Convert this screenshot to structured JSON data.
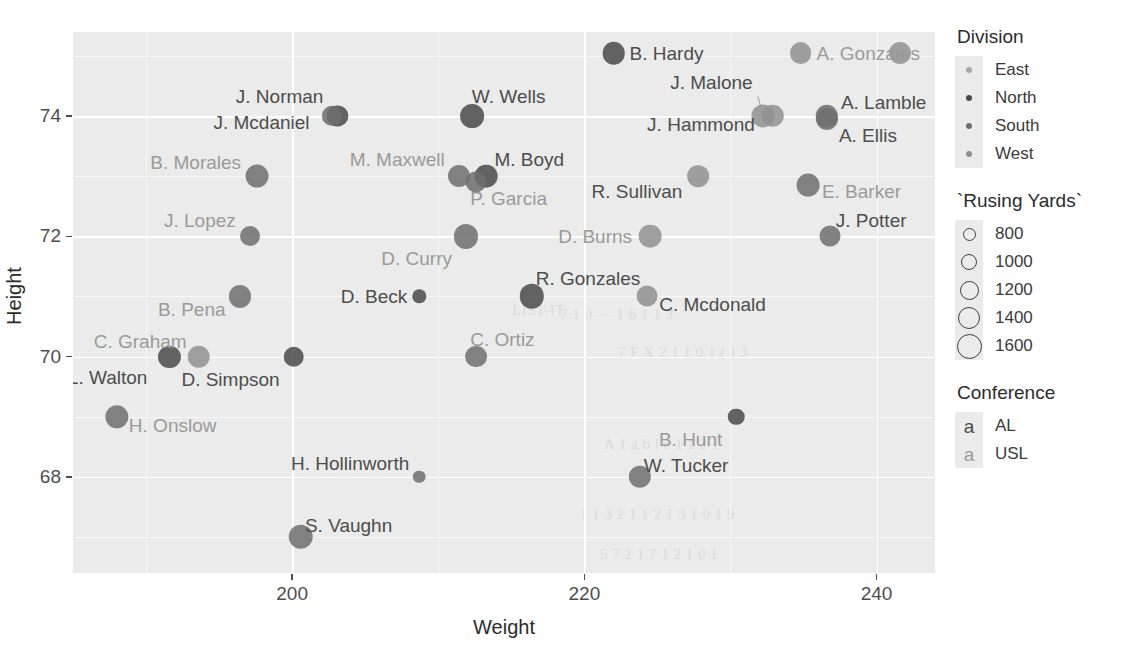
{
  "chart_data": {
    "type": "scatter",
    "title": "",
    "xlabel": "Weight",
    "ylabel": "Height",
    "xlim": [
      185,
      244
    ],
    "ylim": [
      66.4,
      75.4
    ],
    "xticks": [
      200,
      220,
      240
    ],
    "yticks": [
      68,
      70,
      72,
      74
    ],
    "grid": true,
    "legend_position": "right",
    "size_legend_title": "`Rusing Yards`",
    "color_legend_title": "Division",
    "text_legend_title": "Conference",
    "points": [
      {
        "label": "B. Hardy",
        "weight": 222.0,
        "height": 75.05,
        "rushing_yards": 1290,
        "division": "North",
        "conference": "AL",
        "label_side": "right",
        "label_dx": 16,
        "label_dy": 0
      },
      {
        "label": "A. Gonzales",
        "weight": 234.8,
        "height": 75.05,
        "rushing_yards": 1230,
        "division": "West",
        "conference": "USL",
        "label_side": "right",
        "label_dx": 16,
        "label_dy": 0
      },
      {
        "label": "Gonzales",
        "weight": 241.6,
        "height": 75.05,
        "rushing_yards": 1250,
        "division": "West",
        "conference": "USL",
        "label_side": "none",
        "label_dx": 0,
        "label_dy": 0
      },
      {
        "label": "J. Norman",
        "weight": 203.1,
        "height": 74.0,
        "rushing_yards": 1180,
        "division": "North",
        "conference": "AL",
        "label_side": "left",
        "label_dx": -14,
        "label_dy": -20
      },
      {
        "label": "J. Mcdaniel",
        "weight": 202.7,
        "height": 74.0,
        "rushing_yards": 1120,
        "division": "South",
        "conference": "AL",
        "label_side": "left",
        "label_dx": -22,
        "label_dy": 6
      },
      {
        "label": "W. Wells",
        "weight": 212.3,
        "height": 74.0,
        "rushing_yards": 1390,
        "division": "North",
        "conference": "AL",
        "label_side": "right",
        "label_dx": 0,
        "label_dy": -20
      },
      {
        "label": "J. Malone",
        "weight": 232.2,
        "height": 74.0,
        "rushing_yards": 1330,
        "division": "West",
        "conference": "AL",
        "label_side": "left",
        "label_dx": -10,
        "label_dy": -34
      },
      {
        "label": "J. Hammond",
        "weight": 232.9,
        "height": 74.0,
        "rushing_yards": 1270,
        "division": "West",
        "conference": "AL",
        "label_side": "left",
        "label_dx": -18,
        "label_dy": 8
      },
      {
        "label": "A. Lamble",
        "weight": 236.6,
        "height": 74.0,
        "rushing_yards": 1280,
        "division": "South",
        "conference": "AL",
        "label_side": "right",
        "label_dx": 14,
        "label_dy": -14
      },
      {
        "label": "A. Ellis",
        "weight": 236.6,
        "height": 73.95,
        "rushing_yards": 1250,
        "division": "South",
        "conference": "AL",
        "label_side": "right",
        "label_dx": 12,
        "label_dy": 16
      },
      {
        "label": "B. Morales",
        "weight": 197.6,
        "height": 73.0,
        "rushing_yards": 1320,
        "division": "South",
        "conference": "USL",
        "label_side": "left",
        "label_dx": -16,
        "label_dy": -14
      },
      {
        "label": "M. Maxwell",
        "weight": 211.4,
        "height": 73.0,
        "rushing_yards": 1250,
        "division": "South",
        "conference": "USL",
        "label_side": "left",
        "label_dx": -14,
        "label_dy": -17
      },
      {
        "label": "M. Boyd",
        "weight": 213.3,
        "height": 73.0,
        "rushing_yards": 1300,
        "division": "North",
        "conference": "AL",
        "label_side": "right",
        "label_dx": 8,
        "label_dy": -17
      },
      {
        "label": "P. Garcia",
        "weight": 212.6,
        "height": 72.9,
        "rushing_yards": 1180,
        "division": "South",
        "conference": "USL",
        "label_side": "right",
        "label_dx": -6,
        "label_dy": 16
      },
      {
        "label": "R. Sullivan",
        "weight": 227.8,
        "height": 73.0,
        "rushing_yards": 1220,
        "division": "West",
        "conference": "AL",
        "label_side": "left",
        "label_dx": -16,
        "label_dy": 15
      },
      {
        "label": "E. Barker",
        "weight": 235.3,
        "height": 72.85,
        "rushing_yards": 1310,
        "division": "South",
        "conference": "USL",
        "label_side": "right",
        "label_dx": 14,
        "label_dy": 6
      },
      {
        "label": "J. Lopez",
        "weight": 197.1,
        "height": 72.0,
        "rushing_yards": 1100,
        "division": "South",
        "conference": "USL",
        "label_side": "left",
        "label_dx": -14,
        "label_dy": -16
      },
      {
        "label": "D. Curry",
        "weight": 211.9,
        "height": 72.0,
        "rushing_yards": 1420,
        "division": "South",
        "conference": "USL",
        "label_side": "left",
        "label_dx": -14,
        "label_dy": 22
      },
      {
        "label": "D. Burns",
        "weight": 224.5,
        "height": 72.0,
        "rushing_yards": 1300,
        "division": "West",
        "conference": "USL",
        "label_side": "left",
        "label_dx": -18,
        "label_dy": 0
      },
      {
        "label": "J. Potter",
        "weight": 236.8,
        "height": 72.0,
        "rushing_yards": 1170,
        "division": "South",
        "conference": "AL",
        "label_side": "right",
        "label_dx": 6,
        "label_dy": -16
      },
      {
        "label": "B. Pena",
        "weight": 196.4,
        "height": 71.0,
        "rushing_yards": 1250,
        "division": "South",
        "conference": "USL",
        "label_side": "left",
        "label_dx": -14,
        "label_dy": 13
      },
      {
        "label": "D. Beck",
        "weight": 208.7,
        "height": 71.0,
        "rushing_yards": 780,
        "division": "North",
        "conference": "AL",
        "label_side": "left",
        "label_dx": -12,
        "label_dy": 0
      },
      {
        "label": "R. Gonzales",
        "weight": 216.4,
        "height": 71.0,
        "rushing_yards": 1450,
        "division": "North",
        "conference": "AL",
        "label_side": "right",
        "label_dx": 4,
        "label_dy": -18
      },
      {
        "label": "C. Mcdonald",
        "weight": 224.3,
        "height": 71.0,
        "rushing_yards": 1160,
        "division": "West",
        "conference": "AL",
        "label_side": "right",
        "label_dx": 12,
        "label_dy": 8
      },
      {
        "label": "C. Graham",
        "weight": 193.6,
        "height": 70.0,
        "rushing_yards": 1290,
        "division": "West",
        "conference": "USL",
        "label_side": "left",
        "label_dx": -12,
        "label_dy": -16
      },
      {
        "label": "L. Walton",
        "weight": 191.6,
        "height": 70.0,
        "rushing_yards": 1250,
        "division": "North",
        "conference": "AL",
        "label_side": "left",
        "label_dx": -22,
        "label_dy": 20
      },
      {
        "label": "D. Simpson",
        "weight": 200.1,
        "height": 70.0,
        "rushing_yards": 1140,
        "division": "North",
        "conference": "AL",
        "label_side": "left",
        "label_dx": -14,
        "label_dy": 22
      },
      {
        "label": "C. Ortiz",
        "weight": 212.6,
        "height": 70.0,
        "rushing_yards": 1230,
        "division": "South",
        "conference": "USL",
        "label_side": "right",
        "label_dx": -6,
        "label_dy": -18
      },
      {
        "label": "H. Onslow",
        "weight": 188.0,
        "height": 69.0,
        "rushing_yards": 1350,
        "division": "South",
        "conference": "USL",
        "label_side": "right",
        "label_dx": 12,
        "label_dy": 8
      },
      {
        "label": "B. Hunt",
        "weight": 230.4,
        "height": 69.0,
        "rushing_yards": 900,
        "division": "North",
        "conference": "USL",
        "label_side": "left",
        "label_dx": -14,
        "label_dy": 22
      },
      {
        "label": "H. Hollinworth",
        "weight": 208.7,
        "height": 68.0,
        "rushing_yards": 760,
        "division": "South",
        "conference": "AL",
        "label_side": "left",
        "label_dx": -10,
        "label_dy": -14
      },
      {
        "label": "W. Tucker",
        "weight": 223.8,
        "height": 68.0,
        "rushing_yards": 1270,
        "division": "South",
        "conference": "AL",
        "label_side": "right",
        "label_dx": 4,
        "label_dy": -12
      },
      {
        "label": "S. Vaughn",
        "weight": 200.6,
        "height": 67.0,
        "rushing_yards": 1460,
        "division": "South",
        "conference": "AL",
        "label_side": "right",
        "label_dx": 4,
        "label_dy": -12
      }
    ]
  },
  "axes": {
    "x": {
      "title": "Weight",
      "ticks": [
        "200",
        "220",
        "240"
      ]
    },
    "y": {
      "title": "Height",
      "ticks": [
        "74",
        "72",
        "70",
        "68"
      ]
    }
  },
  "legends": {
    "division": {
      "title": "Division",
      "items": [
        {
          "label": "East",
          "color": "#a8a8a8"
        },
        {
          "label": "North",
          "color": "#4a4a4a"
        },
        {
          "label": "South",
          "color": "#6e6e6e"
        },
        {
          "label": "West",
          "color": "#909090"
        }
      ]
    },
    "rushing_yards": {
      "title": "`Rusing Yards`",
      "items": [
        {
          "label": "800",
          "size": 11
        },
        {
          "label": "1000",
          "size": 14
        },
        {
          "label": "1200",
          "size": 17
        },
        {
          "label": "1400",
          "size": 20
        },
        {
          "label": "1600",
          "size": 23
        }
      ]
    },
    "conference": {
      "title": "Conference",
      "items": [
        {
          "label": "AL",
          "glyph": "a",
          "color": "#4d4d4d"
        },
        {
          "label": "USL",
          "glyph": "a",
          "color": "#9a9a9a"
        }
      ]
    }
  },
  "theme": {
    "panel_bg": "#ebebeb",
    "grid_major": "#ffffff",
    "grid_minor": "#f7f7f7",
    "text_color": "#2b2b2b"
  },
  "ghost_text": [
    {
      "text": "LIST-IT",
      "x": 512,
      "y": 302,
      "size": 15,
      "rot": 0
    },
    {
      "text": "7 1 0 — 1 6 1 1 3",
      "x": 560,
      "y": 306,
      "size": 15,
      "rot": 0
    },
    {
      "text": "7 F X 2 1 1 0 1 ( ) 3",
      "x": 618,
      "y": 344,
      "size": 15,
      "rot": 0
    },
    {
      "text": "A 1 a b l e 1 1 2 1",
      "x": 604,
      "y": 436,
      "size": 15,
      "rot": 0
    },
    {
      "text": "1 1 3 2 1 1 2 1 3 1 0 1 9",
      "x": 580,
      "y": 506,
      "size": 15,
      "rot": 0
    },
    {
      "text": "5 7 2 1 7 1 2 1 0 1",
      "x": 600,
      "y": 546,
      "size": 15,
      "rot": 0
    }
  ]
}
